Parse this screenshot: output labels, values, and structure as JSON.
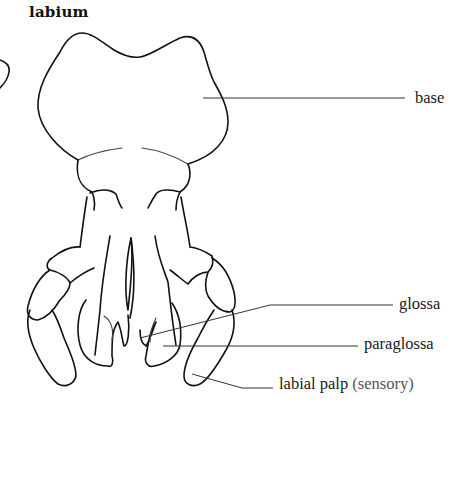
{
  "figure": {
    "title": "labium",
    "labels": {
      "base": "base",
      "glossa": "glossa",
      "paraglossa": "paraglossa",
      "labial_palp": "labial palp",
      "labial_palp_note": "(sensory)"
    }
  },
  "colors": {
    "ink": "#111111",
    "background": "#ffffff"
  }
}
